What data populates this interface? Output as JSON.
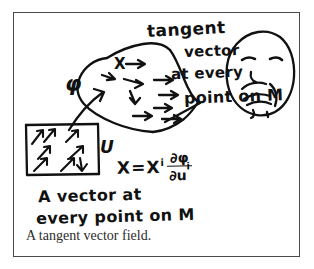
{
  "figure": {
    "caption": "A tangent vector field.",
    "ink_color": "#111111",
    "frame_color": "#4a4a4a",
    "background": "#ffffff",
    "annotations": {
      "tangent": "tangent",
      "vector": "vector",
      "at_every": "at every",
      "point_on_m": "point on M",
      "phi": "φ",
      "vector_field_symbol": "X",
      "chart_domain_label": "U",
      "vector_at": "A vector at",
      "every_point_on_m": "every point on M"
    },
    "formula": {
      "lhs": "X",
      "equals": "=",
      "component": "X",
      "component_index": "i",
      "numerator": "∂φ",
      "denominator": "∂u",
      "denominator_index": "i"
    },
    "doodle": {
      "name": "thinking-face",
      "description": "hand-drawn face with hand on chin"
    },
    "manifold": {
      "name": "manifold-blob",
      "arrow_count": 9
    },
    "chart_box": {
      "name": "coordinate-patch-box",
      "arrow_count": 8
    }
  }
}
